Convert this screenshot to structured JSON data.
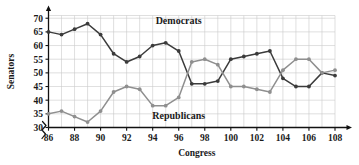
{
  "chart_data": {
    "type": "line",
    "title": "",
    "subtitle": "",
    "xlabel": "Congress",
    "ylabel": "Senators",
    "x": [
      86,
      87,
      88,
      89,
      90,
      91,
      92,
      93,
      94,
      95,
      96,
      97,
      98,
      99,
      100,
      101,
      102,
      103,
      104,
      105,
      106,
      107,
      108
    ],
    "xlim": [
      86,
      108
    ],
    "ylim": [
      30,
      71
    ],
    "grid": true,
    "y_ticks": [
      30,
      35,
      40,
      45,
      50,
      55,
      60,
      65,
      70
    ],
    "x_ticks": [
      86,
      88,
      90,
      92,
      94,
      96,
      98,
      100,
      102,
      104,
      106,
      108
    ],
    "x_minor_step": 1,
    "axis_break": true,
    "legend_position": "inline-annotations",
    "series": [
      {
        "name": "Democrats",
        "color": "#3b3b3b",
        "marker": "circle",
        "label_x": 96,
        "label_y": 68,
        "values": [
          65,
          64,
          66,
          68,
          64,
          57,
          54,
          56,
          60,
          61,
          58,
          46,
          46,
          47,
          55,
          56,
          57,
          58,
          48,
          45,
          45,
          50,
          49
        ]
      },
      {
        "name": "Republicans",
        "color": "#8f8f8f",
        "marker": "circle",
        "label_x": 96,
        "label_y": 33,
        "values": [
          35,
          36,
          34,
          32,
          36,
          43,
          45,
          44,
          38,
          38,
          41,
          54,
          55,
          53,
          45,
          45,
          44,
          43,
          51,
          55,
          55,
          50,
          51
        ]
      }
    ],
    "annotations": [
      {
        "text": "Democrats",
        "x": 96,
        "y": 68
      },
      {
        "text": "Republicans",
        "x": 96,
        "y": 33
      }
    ]
  }
}
